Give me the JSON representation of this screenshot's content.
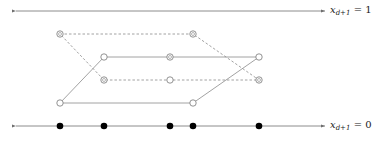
{
  "diagram": {
    "top_axis": {
      "y": 11,
      "x_start": 16,
      "x_end": 325,
      "label_var": "x",
      "label_sub": "d+1",
      "label_rhs": "= 1"
    },
    "bottom_axis": {
      "y": 126,
      "x_start": 16,
      "x_end": 325,
      "label_var": "x",
      "label_sub": "d+1",
      "label_rhs": "= 0"
    },
    "solid_parallelogram": [
      [
        60,
        103
      ],
      [
        104,
        57
      ],
      [
        259,
        57
      ],
      [
        193,
        103
      ]
    ],
    "dashed_parallelogram": [
      [
        60,
        34
      ],
      [
        193,
        34
      ],
      [
        259,
        80
      ],
      [
        104,
        80
      ]
    ],
    "open_points": [
      {
        "x": 60,
        "y": 34,
        "marked": true
      },
      {
        "x": 193,
        "y": 34,
        "marked": true
      },
      {
        "x": 104,
        "y": 57,
        "marked": false
      },
      {
        "x": 170,
        "y": 57,
        "marked": true
      },
      {
        "x": 259,
        "y": 57,
        "marked": false
      },
      {
        "x": 104,
        "y": 80,
        "marked": true
      },
      {
        "x": 170,
        "y": 80,
        "marked": false
      },
      {
        "x": 259,
        "y": 80,
        "marked": true
      },
      {
        "x": 60,
        "y": 103,
        "marked": false
      },
      {
        "x": 193,
        "y": 103,
        "marked": false
      }
    ],
    "projected_points_x": [
      60,
      104,
      170,
      193,
      259
    ],
    "colors": {
      "axis": "#6e6e6e",
      "edge": "#8a8a8a",
      "dot": "#000000"
    }
  }
}
